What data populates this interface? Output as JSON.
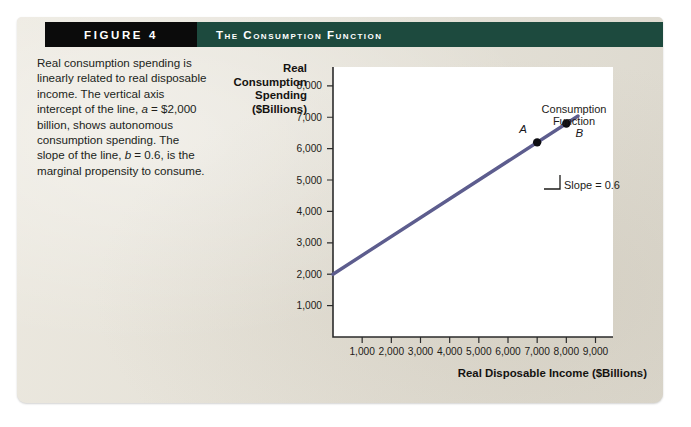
{
  "header": {
    "figure_number": "FIGURE 4",
    "figure_title": "The Consumption Function"
  },
  "caption": {
    "line1": "Real consumption spending is linearly related to real disposable income. The vertical axis intercept of the line, ",
    "var_a": "a",
    "line2": " = $2,000 billion, shows autonomous consumption spending. The slope of the line, ",
    "var_b": "b",
    "line3": " = 0.6, is the marginal propensity to consume."
  },
  "chart_data": {
    "type": "line",
    "title": "The Consumption Function",
    "xlabel": "Real Disposable Income ($Billions)",
    "ylabel": "Real Consumption Spending ($Billions)",
    "xlim": [
      0,
      9600
    ],
    "ylim": [
      0,
      8600
    ],
    "grid": false,
    "legend": "none",
    "xticks": [
      1000,
      2000,
      3000,
      4000,
      5000,
      6000,
      7000,
      8000,
      9000
    ],
    "xtick_labels": [
      "1,000",
      "2,000",
      "3,000",
      "4,000",
      "5,000",
      "6,000",
      "7,000",
      "8,000",
      "9,000"
    ],
    "yticks": [
      1000,
      2000,
      3000,
      4000,
      5000,
      6000,
      7000,
      8000
    ],
    "ytick_labels": [
      "1,000",
      "2,000",
      "3,000",
      "4,000",
      "5,000",
      "6,000",
      "7,000",
      "8,000"
    ],
    "series": [
      {
        "name": "Consumption Function",
        "equation": "C = 2000 + 0.6 Y",
        "intercept": 2000,
        "slope": 0.6,
        "x": [
          0,
          8400
        ],
        "y": [
          2000,
          7040
        ],
        "color": "#5d5d8e"
      }
    ],
    "points": [
      {
        "label": "A",
        "x": 7000,
        "y": 6200
      },
      {
        "label": "B",
        "x": 8000,
        "y": 6800
      }
    ],
    "annotations": [
      {
        "name": "curve-label",
        "line1": "Consumption",
        "line2": "Function"
      },
      {
        "name": "slope-label",
        "text": "Slope = 0.6"
      }
    ]
  },
  "colors": {
    "header_black": "#0b0b0b",
    "header_green": "#1d4a3e",
    "paper": "#e8e4d9",
    "line": "#5d5d8e",
    "plot_bg": "#ffffff"
  }
}
